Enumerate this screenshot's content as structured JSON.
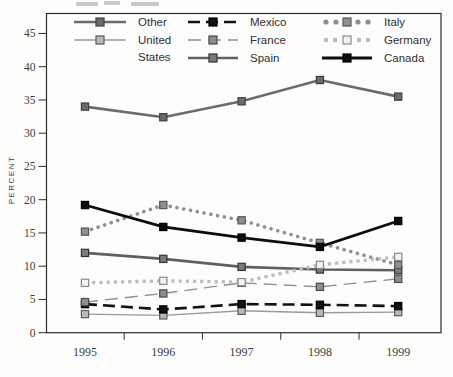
{
  "chart_data": {
    "type": "line",
    "title": "",
    "xlabel": "",
    "ylabel": "PERCENT",
    "x_categories": [
      "1995",
      "1996",
      "1997",
      "1998",
      "1999"
    ],
    "y_ticks": [
      0,
      5,
      10,
      15,
      20,
      25,
      30,
      35,
      40,
      45
    ],
    "ylim": [
      0,
      48
    ],
    "grid": false,
    "legend_position": "top-inside",
    "frame_color": "#2e2e2e",
    "text_color": "#3c3c3c",
    "series": [
      {
        "name": "Other",
        "label_lines": [
          "Other"
        ],
        "values": [
          34.0,
          32.4,
          34.8,
          38.0,
          35.5
        ],
        "color": "#6b6b6b",
        "style": "solid",
        "width": 2.6,
        "marker_fill": "#6b6b6b",
        "marker_stroke": "#3f3f3f"
      },
      {
        "name": "United States",
        "label_lines": [
          "United",
          "States"
        ],
        "values": [
          2.8,
          2.6,
          3.3,
          3.0,
          3.1
        ],
        "color": "#9a9a9a",
        "style": "solid",
        "width": 1.4,
        "marker_fill": "#b8b8b8",
        "marker_stroke": "#5a5a5a"
      },
      {
        "name": "Mexico",
        "label_lines": [
          "Mexico"
        ],
        "values": [
          4.3,
          3.5,
          4.3,
          4.2,
          4.0
        ],
        "color": "#121212",
        "style": "dash",
        "width": 2.6,
        "marker_fill": "#121212",
        "marker_stroke": "#000000"
      },
      {
        "name": "France",
        "label_lines": [
          "France"
        ],
        "values": [
          4.6,
          5.9,
          7.5,
          6.9,
          8.1
        ],
        "color": "#8f8f8f",
        "style": "longdash",
        "width": 1.4,
        "marker_fill": "#8f8f8f",
        "marker_stroke": "#4a4a4a"
      },
      {
        "name": "Spain",
        "label_lines": [
          "Spain"
        ],
        "values": [
          12.0,
          11.1,
          9.9,
          9.5,
          9.4
        ],
        "color": "#5f5f5f",
        "style": "solid",
        "width": 2.6,
        "marker_fill": "#7a7a7a",
        "marker_stroke": "#333333"
      },
      {
        "name": "Italy",
        "label_lines": [
          "Italy"
        ],
        "values": [
          15.2,
          19.2,
          16.9,
          13.5,
          10.2
        ],
        "color": "#8f8f8f",
        "style": "dot",
        "width": 3.6,
        "marker_fill": "#8f8f8f",
        "marker_stroke": "#565656"
      },
      {
        "name": "Germany",
        "label_lines": [
          "Germany"
        ],
        "values": [
          7.5,
          7.8,
          7.6,
          10.2,
          11.4
        ],
        "color": "#bdbdbd",
        "style": "squaredot",
        "width": 3.4,
        "marker_fill": "#f2f2f2",
        "marker_stroke": "#8a8a8a"
      },
      {
        "name": "Canada",
        "label_lines": [
          "Canada"
        ],
        "values": [
          19.2,
          15.9,
          14.3,
          12.9,
          16.8
        ],
        "color": "#0d0d0d",
        "style": "solid",
        "width": 2.8,
        "marker_fill": "#0d0d0d",
        "marker_stroke": "#000000"
      }
    ],
    "legend_columns": [
      [
        "Other",
        "United States"
      ],
      [
        "Mexico",
        "France",
        "Spain"
      ],
      [
        "Italy",
        "Germany",
        "Canada"
      ]
    ]
  }
}
